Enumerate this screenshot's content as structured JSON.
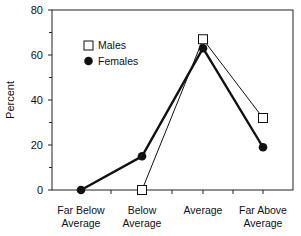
{
  "chart_data": {
    "type": "line",
    "title": "",
    "xlabel": "",
    "ylabel": "Percent",
    "ylim": [
      0,
      80
    ],
    "yticks": [
      0,
      20,
      40,
      60,
      80
    ],
    "grid": false,
    "legend_position": "upper-left-inside",
    "categories": [
      [
        "Far Below",
        "Average"
      ],
      [
        "Below",
        "Average"
      ],
      [
        "Average"
      ],
      [
        "Far Above",
        "Average"
      ]
    ],
    "category_names": [
      "Far Below Average",
      "Below Average",
      "Average",
      "Far Above Average"
    ],
    "series": [
      {
        "name": "Males",
        "marker": "open-square",
        "line": "thin",
        "values": [
          null,
          0,
          67,
          32
        ]
      },
      {
        "name": "Females",
        "marker": "filled-circle",
        "line": "thick",
        "values": [
          0,
          15,
          63,
          19
        ]
      }
    ]
  },
  "legend": {
    "males_label": "Males",
    "females_label": "Females"
  },
  "axis": {
    "ylabel": "Percent",
    "y_tick_labels": [
      "0",
      "20",
      "40",
      "60",
      "80"
    ]
  }
}
